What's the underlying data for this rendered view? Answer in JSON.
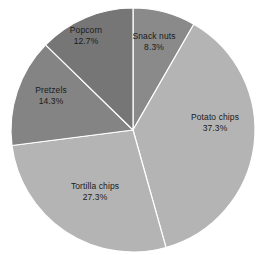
{
  "chart_data": {
    "type": "pie",
    "title": "",
    "subtitle": "",
    "xlabel": "",
    "ylabel": "",
    "grid": false,
    "legend_position": "none",
    "label_format": "name + percent",
    "start_angle_deg": 0,
    "direction": "clockwise",
    "categories": [
      "Snack nuts",
      "Potato chips",
      "Tortilla chips",
      "Pretzels",
      "Popcorn"
    ],
    "values": [
      8.3,
      37.3,
      27.3,
      14.3,
      12.7
    ],
    "total": 99.9,
    "slices": [
      {
        "name": "Snack nuts",
        "value": 8.3,
        "percent_text": "8.3%",
        "color": "#8a8a8a",
        "label_x": 154,
        "label_y": 36
      },
      {
        "name": "Potato chips",
        "value": 37.3,
        "percent_text": "37.3%",
        "color": "#b4b4b4",
        "label_x": 215,
        "label_y": 117
      },
      {
        "name": "Tortilla chips",
        "value": 27.3,
        "percent_text": "27.3%",
        "color": "#b4b4b4",
        "label_x": 95,
        "label_y": 186
      },
      {
        "name": "Pretzels",
        "value": 14.3,
        "percent_text": "14.3%",
        "color": "#848484",
        "label_x": 51,
        "label_y": 90
      },
      {
        "name": "Popcorn",
        "value": 12.7,
        "percent_text": "12.7%",
        "color": "#767676",
        "label_x": 86,
        "label_y": 30
      }
    ],
    "geometry": {
      "center_x": 133,
      "center_y": 130,
      "radius": 122
    },
    "style": {
      "background": "#ffffff",
      "separator_color": "#ffffff",
      "label_color": "#1a1a1a"
    }
  }
}
